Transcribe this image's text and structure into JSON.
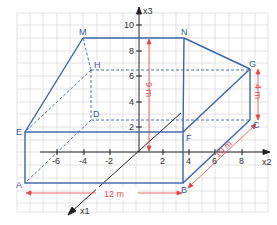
{
  "colors": {
    "edge": "#3d64a8",
    "grid": "#dcdcdc",
    "grid_red": "#f2caca",
    "axis": "#222222",
    "dimension": "#e04848",
    "background": "#ffffff"
  },
  "axes": {
    "x1_label": "x1",
    "x2_label": "x2",
    "x3_label": "x3",
    "x2_ticks": [
      "-6",
      "-4",
      "-2",
      "2",
      "4",
      "6",
      "8"
    ],
    "x3_ticks": [
      "2",
      "4",
      "6",
      "8",
      "10"
    ],
    "x1_ticks": [
      "2",
      "4",
      "6"
    ]
  },
  "points": {
    "A": "A",
    "B": "B",
    "C": "C",
    "D": "D",
    "E": "E",
    "F": "F",
    "G": "G",
    "H": "H",
    "M": "M",
    "N": "N"
  },
  "dimensions": {
    "length": "12 m",
    "depth": "10 m",
    "height_high": "9 m",
    "height_low": "4 m"
  }
}
